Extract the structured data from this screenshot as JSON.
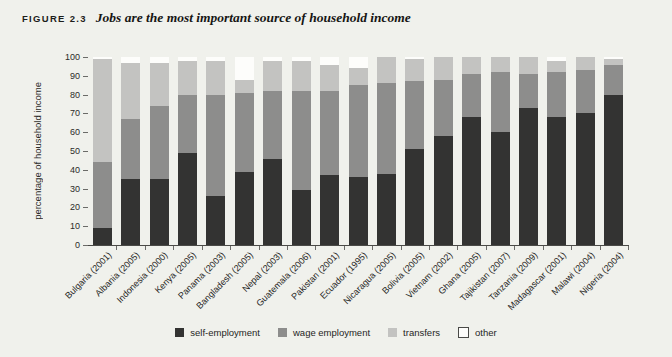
{
  "figure": {
    "label": "FIGURE 2.3",
    "title": "Jobs are the most important source of household income"
  },
  "chart_data": {
    "type": "bar",
    "stacked": true,
    "title": "Jobs are the most important source of household income",
    "xlabel": "",
    "ylabel": "percentage of household income",
    "ylim": [
      0,
      100
    ],
    "y_ticks": [
      0,
      10,
      20,
      30,
      40,
      50,
      60,
      70,
      80,
      90,
      100
    ],
    "grid": false,
    "legend_position": "bottom",
    "categories": [
      "Bulgaria (2001)",
      "Albania (2005)",
      "Indonesia (2000)",
      "Kenya (2005)",
      "Panama (2003)",
      "Bangladesh (2005)",
      "Nepal (2003)",
      "Guatemala (2006)",
      "Pakistan (2001)",
      "Ecuador (1995)",
      "Nicaragua (2005)",
      "Bolivia (2005)",
      "Vietnam (2002)",
      "Ghana (2005)",
      "Tajikistan (2007)",
      "Tanzania (2009)",
      "Madagascar (2001)",
      "Malawi (2004)",
      "Nigeria (2004)"
    ],
    "series": [
      {
        "name": "self-employment",
        "color": "#333332",
        "swatch_border": null,
        "values": [
          9,
          35,
          35,
          49,
          26,
          39,
          46,
          29,
          37,
          36,
          38,
          51,
          58,
          68,
          60,
          73,
          68,
          70,
          80
        ]
      },
      {
        "name": "wage employment",
        "color": "#8d8d8c",
        "swatch_border": null,
        "values": [
          35,
          32,
          39,
          31,
          54,
          42,
          36,
          53,
          45,
          49,
          48,
          36,
          30,
          23,
          32,
          18,
          24,
          23,
          16
        ]
      },
      {
        "name": "transfers",
        "color": "#c3c3c1",
        "swatch_border": null,
        "values": [
          55,
          30,
          23,
          18,
          18,
          7,
          16,
          16,
          14,
          9,
          14,
          12,
          12,
          9,
          8,
          9,
          6,
          7,
          3
        ]
      },
      {
        "name": "other",
        "color": "#fdfdfb",
        "swatch_border": "#4a4a47",
        "values": [
          1,
          3,
          3,
          2,
          2,
          12,
          2,
          2,
          4,
          6,
          0,
          1,
          0,
          0,
          0,
          0,
          2,
          0,
          1
        ]
      }
    ]
  }
}
